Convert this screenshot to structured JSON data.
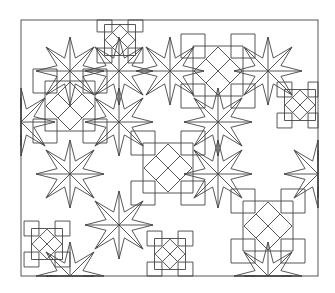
{
  "figure": {
    "stroke_color": "#444444",
    "background": "#ffffff",
    "frame": {
      "x": 21,
      "y": 20,
      "width": 297,
      "height": 256
    },
    "rosettes": [
      {
        "cx": 70,
        "cy": 106
      },
      {
        "cx": 218,
        "cy": 71
      },
      {
        "cx": 168,
        "cy": 168
      },
      {
        "cx": 268,
        "cy": 226
      }
    ],
    "small_rosettes": [
      {
        "cx": 47,
        "cy": 244
      },
      {
        "cx": 170,
        "cy": 254
      },
      {
        "cx": 300,
        "cy": 105
      },
      {
        "cx": 120,
        "cy": 40
      }
    ],
    "stars": [
      {
        "cx": 70,
        "cy": 71
      },
      {
        "cx": 119,
        "cy": 71
      },
      {
        "cx": 170,
        "cy": 71
      },
      {
        "cx": 268,
        "cy": 71
      },
      {
        "cx": 21,
        "cy": 122
      },
      {
        "cx": 119,
        "cy": 122
      },
      {
        "cx": 218,
        "cy": 122
      },
      {
        "cx": 70,
        "cy": 174
      },
      {
        "cx": 119,
        "cy": 225
      },
      {
        "cx": 218,
        "cy": 174
      },
      {
        "cx": 318,
        "cy": 174
      },
      {
        "cx": 70,
        "cy": 276
      },
      {
        "cx": 268,
        "cy": 276
      }
    ]
  }
}
